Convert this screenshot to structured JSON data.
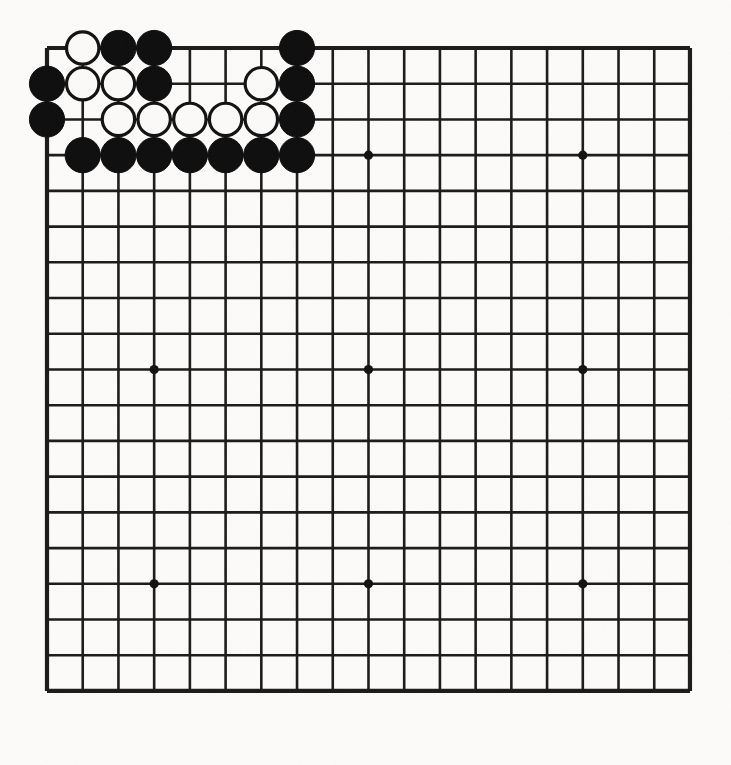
{
  "app": {
    "title": "Go Board Position",
    "kind": "goban-diagram"
  },
  "board": {
    "size": 19,
    "label": "19x19 Go board",
    "background_color": "#fcfbfa",
    "line_color": "#1a1a1a",
    "black_stone_color": "#0d0d0d",
    "white_stone_color": "#fbfaf8",
    "origin_x": 47,
    "origin_y": 48,
    "spacing": 35.72,
    "stone_radius": 17.6,
    "star_radius": 4.6,
    "star_points": [
      [
        4,
        4
      ],
      [
        10,
        4
      ],
      [
        16,
        4
      ],
      [
        4,
        10
      ],
      [
        10,
        10
      ],
      [
        16,
        10
      ],
      [
        4,
        16
      ],
      [
        10,
        16
      ],
      [
        16,
        16
      ]
    ],
    "black_stones": [
      [
        3,
        1
      ],
      [
        4,
        1
      ],
      [
        8,
        1
      ],
      [
        1,
        2
      ],
      [
        4,
        2
      ],
      [
        8,
        2
      ],
      [
        1,
        3
      ],
      [
        8,
        3
      ],
      [
        2,
        4
      ],
      [
        3,
        4
      ],
      [
        4,
        4
      ],
      [
        5,
        4
      ],
      [
        6,
        4
      ],
      [
        7,
        4
      ],
      [
        8,
        4
      ]
    ],
    "white_stones": [
      [
        2,
        1
      ],
      [
        2,
        2
      ],
      [
        3,
        2
      ],
      [
        7,
        2
      ],
      [
        3,
        3
      ],
      [
        4,
        3
      ],
      [
        5,
        3
      ],
      [
        6,
        3
      ],
      [
        7,
        3
      ]
    ],
    "black_stone_count": 15,
    "white_stone_count": 9
  }
}
